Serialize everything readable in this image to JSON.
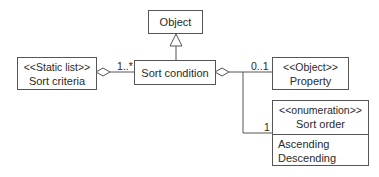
{
  "diagram": {
    "type": "uml-class-diagram",
    "classes": {
      "object": {
        "name": "Object"
      },
      "sort_condition": {
        "name": "Sort condition"
      },
      "sort_criteria": {
        "stereotype": "<<Static list>>",
        "name": "Sort criteria"
      },
      "property": {
        "stereotype": "<<Object>>",
        "name": "Property"
      },
      "sort_order": {
        "stereotype": "<<onumeration>>",
        "name": "Sort order",
        "literals": [
          "Ascending",
          "Descending"
        ]
      }
    },
    "relations": [
      {
        "type": "generalization",
        "from": "Sort condition",
        "to": "Object"
      },
      {
        "type": "aggregation",
        "whole": "Sort criteria",
        "part": "Sort condition",
        "multiplicity": "1..*"
      },
      {
        "type": "aggregation",
        "whole": "Sort condition",
        "part": "Property",
        "multiplicity": "0..1"
      },
      {
        "type": "aggregation",
        "whole": "Sort condition",
        "part": "Sort order",
        "multiplicity": "1"
      }
    ],
    "multiplicities": {
      "criteria_to_condition": "1..*",
      "condition_to_property": "0..1",
      "condition_to_order": "1"
    },
    "colors": {
      "line": "#555555",
      "text": "#2a2a2a",
      "background": "#ffffff"
    }
  }
}
